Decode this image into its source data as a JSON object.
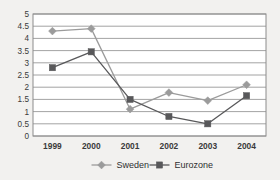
{
  "chart_data": {
    "type": "line",
    "title": "",
    "subtitle": "",
    "xlabel": "",
    "ylabel": "",
    "categories": [
      "1999",
      "2000",
      "2001",
      "2002",
      "2003",
      "2004"
    ],
    "series": [
      {
        "name": "Sweden",
        "color": "#9b9b9b",
        "marker": "diamond",
        "values": [
          4.3,
          4.4,
          1.1,
          1.78,
          1.45,
          2.1
        ]
      },
      {
        "name": "Eurozone",
        "color": "#58585a",
        "marker": "square",
        "values": [
          2.8,
          3.45,
          1.5,
          0.8,
          0.5,
          1.65
        ]
      }
    ],
    "ylim": [
      0,
      5
    ],
    "ytick_step": 0.5,
    "yticks": [
      "0",
      "0.5",
      "1",
      "1.5",
      "2",
      "2.5",
      "3",
      "3.5",
      "4",
      "4.5",
      "5"
    ],
    "grid": true,
    "grid_axis": "y",
    "legend_position": "bottom",
    "plot_background": "#ffffff",
    "page_background": "#f2f1ef",
    "grid_color": "#8c8c8c",
    "border_color": "#8c8c8c"
  }
}
